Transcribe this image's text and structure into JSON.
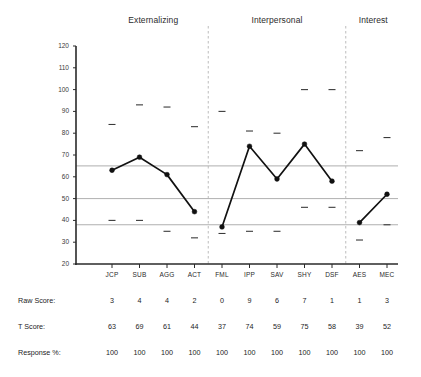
{
  "chart_data": {
    "type": "line",
    "title": "",
    "xlabel": "",
    "ylabel": "",
    "ylim": [
      20,
      120
    ],
    "ytick_step": 10,
    "grid": false,
    "legend": "none",
    "yticks": [
      "120",
      "110",
      "100",
      "90",
      "80",
      "70",
      "60",
      "50",
      "40",
      "30",
      "20"
    ],
    "categories": [
      "JCP",
      "SUB",
      "AGG",
      "ACT",
      "FML",
      "IPP",
      "SAV",
      "SHY",
      "DSF",
      "AES",
      "MEC"
    ],
    "values": [
      63,
      69,
      61,
      44,
      37,
      74,
      59,
      75,
      58,
      39,
      52
    ],
    "ci_upper": [
      84,
      93,
      92,
      83,
      90,
      81,
      80,
      100,
      100,
      72,
      78
    ],
    "ci_lower": [
      40,
      40,
      35,
      32,
      34,
      35,
      35,
      46,
      46,
      31,
      38
    ],
    "reference_lines": [
      65,
      50,
      38
    ],
    "groups": [
      {
        "label": "Externalizing",
        "scales": [
          "JCP",
          "SUB",
          "AGG",
          "ACT"
        ]
      },
      {
        "label": "Interpersonal",
        "scales": [
          "FML",
          "IPP",
          "SAV",
          "SHY",
          "DSF"
        ]
      },
      {
        "label": "Interest",
        "scales": [
          "AES",
          "MEC"
        ]
      }
    ],
    "table": {
      "row_labels": [
        "Raw Score:",
        "T Score:",
        "Response %:"
      ],
      "rows": [
        {
          "label": "Raw Score:",
          "values": [
            "3",
            "4",
            "4",
            "2",
            "0",
            "9",
            "6",
            "7",
            "1",
            "1",
            "3"
          ]
        },
        {
          "label": "T Score:",
          "values": [
            "63",
            "69",
            "61",
            "44",
            "37",
            "74",
            "59",
            "75",
            "58",
            "39",
            "52"
          ]
        },
        {
          "label": "Response %:",
          "values": [
            "100",
            "100",
            "100",
            "100",
            "100",
            "100",
            "100",
            "100",
            "100",
            "100",
            "100"
          ]
        }
      ]
    },
    "colors": {
      "line": "#111111",
      "marker": "#111111",
      "reference_line": "#9a9a9a",
      "divider": "#b4b4b4",
      "axis": "#2a2a2a",
      "ci_marker": "#3a3a3a"
    }
  }
}
